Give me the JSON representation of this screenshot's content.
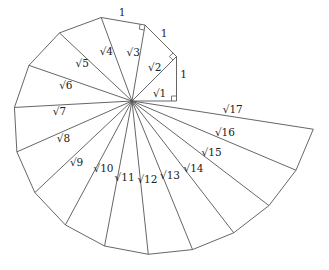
{
  "diagram": {
    "center": [
      132,
      101
    ],
    "unit_px": 44.5,
    "triangles": 16,
    "stroke_color": "#555555",
    "text_color": "#222222",
    "unit_side_label": "1",
    "unit_labels_shown_on_triangles": [
      1,
      2,
      3
    ],
    "hypotenuse_labels": [
      "√1",
      "√2",
      "√3",
      "√4",
      "√5",
      "√6",
      "√7",
      "√8",
      "√9",
      "√10",
      "√11",
      "√12",
      "√13",
      "√14",
      "√15",
      "√16",
      "√17"
    ],
    "right_angle_markers_on_triangles": [
      1,
      2,
      3
    ]
  }
}
